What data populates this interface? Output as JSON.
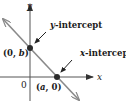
{
  "diagram": {
    "axes": {
      "x_label": "x",
      "y_label": "y",
      "origin_label": "0"
    },
    "points": [
      {
        "label": "(0, b)",
        "name": "y-intercept-point"
      },
      {
        "label": "(a, 0)",
        "name": "x-intercept-point"
      }
    ],
    "annotations": {
      "y_intercept": {
        "prefix": "y",
        "suffix": "-intercept"
      },
      "x_intercept": {
        "prefix": "x",
        "suffix": "-intercept"
      }
    },
    "point_labels": {
      "y_point": {
        "open": "(0, ",
        "var": "b",
        "close": ")"
      },
      "x_point": {
        "open": "(",
        "var": "a",
        "close": ", 0)"
      }
    },
    "colors": {
      "axis": "#555555",
      "line": "#8a8a8a",
      "point": "#2a2a2a",
      "text": "#1a1a1a"
    }
  }
}
